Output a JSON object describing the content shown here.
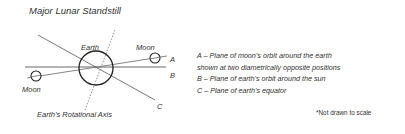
{
  "title": "Major Lunar Standstill",
  "diagram": {
    "earth_label": "Earth",
    "moon_right_label": "Moon",
    "moon_left_label": "Moon",
    "line_a_label": "A",
    "line_b_label": "B",
    "line_c_label": "C",
    "axis_label": "Earth’s Rotational Axis"
  },
  "legend": [
    "A – Plane of moon’s orbit around the earth",
    "shown at two diametrically opposite positions",
    "B – Plane of earth’s orbit around the sun",
    "C – Plane of earth’s equator"
  ],
  "note": "*Not drawn to scale"
}
